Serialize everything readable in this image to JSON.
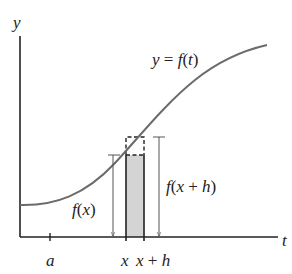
{
  "diagram": {
    "axis_labels": {
      "y": "y",
      "t": "t"
    },
    "curve_label": {
      "lhs": "y",
      "eq": " = ",
      "fn": "f",
      "open": "(",
      "arg": "t",
      "close": ")"
    },
    "tick_labels": {
      "a": "a",
      "x": "x",
      "x_plus_h": {
        "x": "x",
        "plus": " + ",
        "h": "h"
      }
    },
    "height_labels": {
      "fx": {
        "fn": "f",
        "open": "(",
        "arg": "x",
        "close": ")"
      },
      "fxh": {
        "fn": "f",
        "open": "(",
        "arg1": "x",
        "plus": " + ",
        "arg2": "h",
        "close": ")"
      }
    },
    "colors": {
      "axis": "#222222",
      "curve": "#6b6b6b",
      "shade": "#d4d4d4",
      "arrow": "#555555"
    }
  }
}
